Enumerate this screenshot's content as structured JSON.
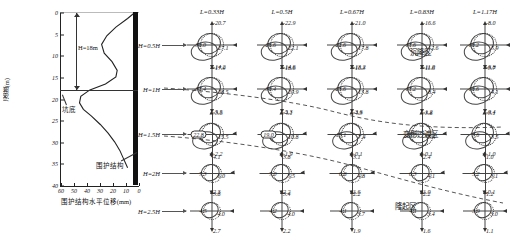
{
  "left_chart": {
    "ylabel": "深度(m)",
    "xlabel": "围护结构水平位移(mm)",
    "yticks": [
      "0",
      "5",
      "10",
      "15",
      "20",
      "25",
      "30",
      "35",
      "40"
    ],
    "xticks": [
      "60",
      "50",
      "40",
      "30",
      "20",
      "10",
      "0"
    ],
    "annotations": {
      "depth_h": "H=18m",
      "pit_bottom": "坑底",
      "wall": "围护结构"
    }
  },
  "chart_data": {
    "type": "line",
    "title": "",
    "xlabel": "围护结构水平位移(mm)",
    "ylabel": "深度(m)",
    "xlim": [
      60,
      0
    ],
    "ylim": [
      40,
      0
    ],
    "grid": false,
    "series": [
      {
        "name": "围护结构水平位移",
        "x": [
          2,
          8,
          17,
          24,
          28,
          26,
          20,
          16,
          17,
          25,
          38,
          45,
          46,
          43,
          37,
          30,
          24,
          19,
          15,
          12,
          9
        ],
        "y": [
          0,
          1.5,
          3.5,
          5.5,
          7.5,
          9.5,
          11.5,
          13.5,
          15,
          16.5,
          18,
          19.5,
          21,
          22.5,
          24,
          26,
          28,
          30,
          32,
          34,
          36
        ]
      }
    ]
  },
  "right_panel": {
    "column_headers": [
      "L=0.33H",
      "L=0.5H",
      "L=0.67H",
      "L=0.83H",
      "L=1.17H"
    ],
    "row_headers": [
      "H=0.5H",
      "H=1H",
      "H=1.5H",
      "H=2H",
      "H=2.5H"
    ],
    "zones": [
      "沉降区",
      "变形过渡区",
      "隆起区"
    ],
    "cells": [
      [
        {
          "left": "30.0",
          "top": "-20.7",
          "right": "27.1",
          "bottom": "-17.9",
          "boxed": false
        },
        {
          "left": "26.6",
          "top": "-22.9",
          "right": "22.1",
          "bottom": "-18.6",
          "boxed": false
        },
        {
          "left": "22.6",
          "top": "-21.0",
          "right": "17.8",
          "bottom": "-16.3",
          "boxed": false
        },
        {
          "left": "17.6",
          "top": "-16.6",
          "right": "12.6",
          "bottom": "-11.6",
          "boxed": false
        },
        {
          "left": "10.2",
          "top": "-8.0",
          "right": "5.9",
          "bottom": "-3.7",
          "boxed": false
        }
      ],
      [
        {
          "left": "37.4",
          "top": "-14.2",
          "right": "28.5",
          "bottom": "-5.5",
          "boxed": false
        },
        {
          "left": "30.4",
          "top": "-14.6",
          "right": "20.9",
          "bottom": "-5.3",
          "boxed": false
        },
        {
          "left": "23.6",
          "top": "-13.2",
          "right": "13.8",
          "bottom": "-3.6",
          "boxed": false
        },
        {
          "left": "17.2",
          "top": "-11.0",
          "right": "8.4",
          "bottom": "-1.2",
          "boxed": false
        },
        {
          "left": "10.6",
          "top": "-6.8",
          "right": "4.1",
          "bottom": "-0.4",
          "boxed": false
        }
      ],
      [
        {
          "left": "22.8",
          "top": "-3.6",
          "right": "15.5",
          "bottom": "4.1",
          "boxed": true
        },
        {
          "left": "19.0",
          "top": "-4.1",
          "right": "10.8",
          "bottom": "3.8",
          "boxed": true
        },
        {
          "left": "15.1",
          "top": "-4.3",
          "right": "7.4",
          "bottom": "3.1",
          "boxed": false
        },
        {
          "left": "11.7",
          "top": "-3.8",
          "right": "5.4",
          "bottom": "2.4",
          "boxed": false
        },
        {
          "left": "7.6",
          "top": "-3.1",
          "right": "3.5",
          "bottom": "1.0",
          "boxed": false
        }
      ],
      [
        {
          "left": "7.3",
          "top": "-2.2",
          "right": "6.0",
          "bottom": "3.8",
          "boxed": false
        },
        {
          "left": "7.0",
          "top": "-1.9",
          "right": "5.5",
          "bottom": "3.4",
          "boxed": false
        },
        {
          "left": "6.8",
          "top": "-0.1",
          "right": "4.8",
          "bottom": "2.2",
          "boxed": false
        },
        {
          "left": "6.3",
          "top": "-0.1",
          "right": "4.1",
          "bottom": "2.2",
          "boxed": false
        },
        {
          "left": "5.2",
          "top": "-1.0",
          "right": "3.1",
          "bottom": "1.2",
          "boxed": false
        }
      ],
      [
        {
          "left": "4.5",
          "top": "2.3",
          "right": "4.0",
          "bottom": "2.7",
          "boxed": false
        },
        {
          "left": "4.2",
          "top": "2.2",
          "right": "4.0",
          "bottom": "2.2",
          "boxed": false
        },
        {
          "left": "4.1",
          "top": "1.6",
          "right": "3.7",
          "bottom": "1.9",
          "boxed": false
        },
        {
          "left": "4.1",
          "top": "1.0",
          "right": "3.4",
          "bottom": "1.6",
          "boxed": false
        },
        {
          "left": "3.9",
          "top": "-0.1",
          "right": "3.0",
          "bottom": "1.1",
          "boxed": false
        }
      ]
    ]
  }
}
